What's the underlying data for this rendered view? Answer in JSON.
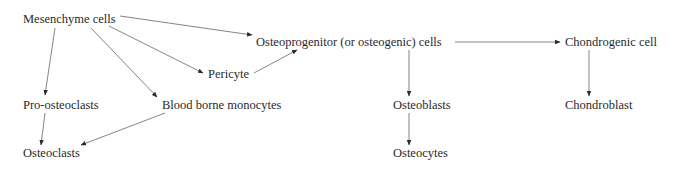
{
  "diagram": {
    "type": "flowchart",
    "title": "",
    "nodes": {
      "mesenchyme": "Mesenchyme cells",
      "osteoprogenitor": "Osteoprogenitor (or osteogenic) cells",
      "chondrogenic": "Chondrogenic cell",
      "pericyte": "Pericyte",
      "pro_osteoclasts": "Pro-osteoclasts",
      "monocytes": "Blood borne monocytes",
      "osteoblasts": "Osteoblasts",
      "chondroblast": "Chondroblast",
      "osteoclasts": "Osteoclasts",
      "osteocytes": "Osteocytes"
    },
    "edges": [
      {
        "from": "Mesenchyme cells",
        "to": "Osteoprogenitor (or osteogenic) cells"
      },
      {
        "from": "Mesenchyme cells",
        "to": "Pericyte"
      },
      {
        "from": "Mesenchyme cells",
        "to": "Pro-osteoclasts"
      },
      {
        "from": "Mesenchyme cells",
        "to": "Blood borne monocytes"
      },
      {
        "from": "Pericyte",
        "to": "Osteoprogenitor (or osteogenic) cells"
      },
      {
        "from": "Osteoprogenitor (or osteogenic) cells",
        "to": "Chondrogenic cell"
      },
      {
        "from": "Osteoprogenitor (or osteogenic) cells",
        "to": "Osteoblasts"
      },
      {
        "from": "Chondrogenic cell",
        "to": "Chondroblast"
      },
      {
        "from": "Pro-osteoclasts",
        "to": "Osteoclasts"
      },
      {
        "from": "Blood borne monocytes",
        "to": "Osteoclasts"
      },
      {
        "from": "Osteoblasts",
        "to": "Osteocytes"
      }
    ],
    "colors": {
      "text": "#2a2a2a",
      "line": "#555555",
      "background": "#ffffff"
    }
  }
}
